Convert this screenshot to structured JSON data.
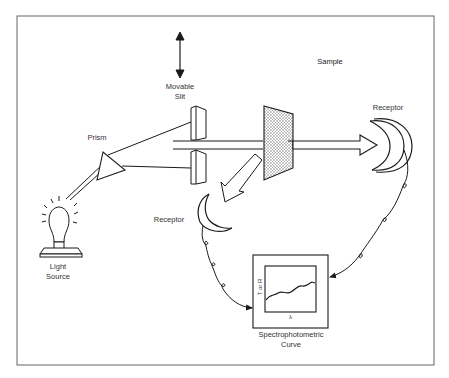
{
  "diagram": {
    "labels": {
      "movable_slit": [
        "Movable",
        "Slit"
      ],
      "sample": "Sample",
      "prism": "Prism",
      "receptor_transmit": "Receptor",
      "receptor_reflect": "Receptor",
      "light_source": [
        "Light",
        "Source"
      ],
      "curve": [
        "Spectrophotometric",
        "Curve"
      ]
    },
    "graph_axes": {
      "y": "T or R",
      "x": "λ"
    },
    "colors": {
      "line": "#1a1a1a",
      "frame": "#666666",
      "sample_fill": "#d8d8d8",
      "background": "#ffffff"
    }
  }
}
